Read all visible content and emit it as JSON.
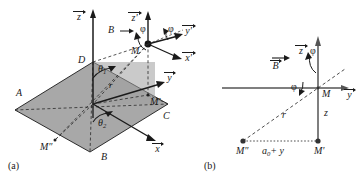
{
  "figure": {
    "caption_a": "(a)",
    "caption_b": "(b)"
  },
  "panel_a": {
    "axes": [
      {
        "name": "z-axis",
        "label": "z",
        "vector": true
      },
      {
        "name": "y-axis",
        "label": "y",
        "vector": true
      },
      {
        "name": "x-axis",
        "label": "x",
        "vector": true
      },
      {
        "name": "z-prime-axis",
        "label": "z",
        "prime": "'",
        "vector": true
      },
      {
        "name": "y-prime-axis",
        "label": "y",
        "prime": "'",
        "vector": true
      },
      {
        "name": "x-prime-axis",
        "label": "x",
        "prime": "'",
        "vector": true
      }
    ],
    "plane_corners": [
      "A",
      "B",
      "C",
      "D"
    ],
    "corner_A": "A",
    "corner_B": "B",
    "corner_C": "C",
    "corner_D": "D",
    "points": {
      "M": "M",
      "M_prime": "M'",
      "M_double_prime": "M″"
    },
    "angles": {
      "theta1": "θ",
      "theta1_sub": "1",
      "theta2": "θ",
      "theta2_sub": "2",
      "phi_left": "φ",
      "phi_right": "φ"
    },
    "radius_label": "r",
    "field_label": "B",
    "field_arrow": "→"
  },
  "panel_b": {
    "axes": [
      {
        "name": "z-axis",
        "label": "z",
        "vector": true
      },
      {
        "name": "y-axis",
        "label": "y",
        "vector": true
      }
    ],
    "field_label": "B",
    "angles": {
      "phi_top": "φ",
      "phi_bottom": "φ"
    },
    "radius_label": "r",
    "height_label": "z",
    "baseline_label": "a",
    "baseline_sub": "0",
    "baseline_rest": "+ y",
    "points": {
      "M": "M",
      "M_prime": "M'",
      "M_double_prime": "M″"
    }
  },
  "colors": {
    "plane_fill": "#a8a8a8",
    "stroke": "#1a1a1a",
    "dashed": "#3a3a3a"
  }
}
